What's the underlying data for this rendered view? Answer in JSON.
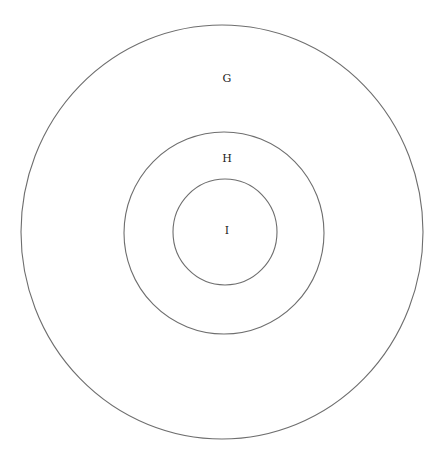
{
  "diagram": {
    "type": "nested-circles",
    "stroke_color": "#6e6e6e",
    "circles": [
      {
        "label": "G",
        "cx": 222,
        "cy": 232,
        "rx": 201,
        "ry": 207,
        "label_x": 227,
        "label_y": 79
      },
      {
        "label": "H",
        "cx": 224,
        "cy": 233,
        "rx": 100,
        "ry": 101,
        "label_x": 227,
        "label_y": 159
      },
      {
        "label": "I",
        "cx": 225,
        "cy": 232,
        "rx": 52,
        "ry": 53,
        "label_x": 227,
        "label_y": 231
      }
    ]
  }
}
